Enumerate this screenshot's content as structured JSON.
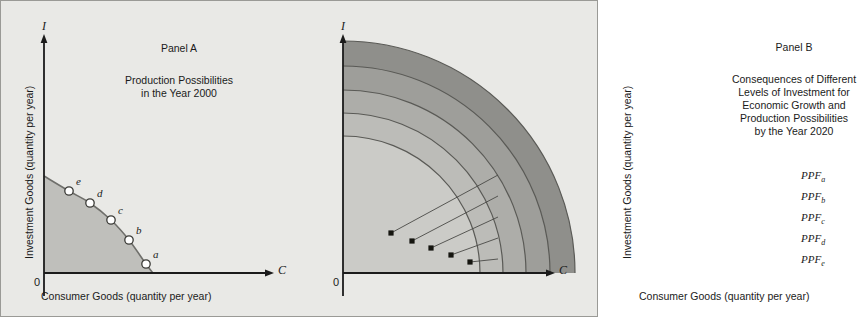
{
  "figure": {
    "background_color": "#e9e9e6",
    "border_color": "#9a9a96"
  },
  "panel_a": {
    "heading": "Panel A",
    "title": "Production Possibilities\nin the Year 2000",
    "y_axis_label": "Investment Goods (quantity per year)",
    "x_axis_label": "Consumer Goods (quantity per year)",
    "y_axis_marker": "I",
    "x_axis_marker": "C",
    "origin_label": "0",
    "curve_fill": "#bfbfbb",
    "curve_stroke": "#6f6f6b",
    "points": [
      {
        "label": "a",
        "x": 145,
        "y": 263
      },
      {
        "label": "b",
        "x": 128,
        "y": 239
      },
      {
        "label": "c",
        "x": 110,
        "y": 219
      },
      {
        "label": "d",
        "x": 89,
        "y": 202
      },
      {
        "label": "e",
        "x": 68,
        "y": 190
      }
    ]
  },
  "panel_b": {
    "heading": "Panel B",
    "title": "Consequences of Different\nLevels of Investment for\nEconomic Growth and\nProduction Possibilities\nby the Year 2020",
    "y_axis_label": "Investment Goods (quantity per year)",
    "x_axis_label": "Consumer Goods (quantity per year)",
    "y_axis_marker": "I",
    "x_axis_marker": "C",
    "origin_label": "0",
    "frontiers": [
      {
        "label": "PPF",
        "subscript": "a",
        "radius": 232,
        "fill": "#8f8f8b",
        "point": {
          "x": 390,
          "y": 232
        }
      },
      {
        "label": "PPF",
        "subscript": "b",
        "radius": 207,
        "fill": "#9e9e9a",
        "point": {
          "x": 411,
          "y": 240
        }
      },
      {
        "label": "PPF",
        "subscript": "c",
        "radius": 183,
        "fill": "#adadA9",
        "point": {
          "x": 430,
          "y": 247
        }
      },
      {
        "label": "PPF",
        "subscript": "d",
        "radius": 160,
        "fill": "#bcbcb8",
        "point": {
          "x": 450,
          "y": 254
        }
      },
      {
        "label": "PPF",
        "subscript": "e",
        "radius": 137,
        "fill": "#cbcbc7",
        "point": {
          "x": 469,
          "y": 261
        }
      }
    ],
    "arc_stroke": "#5a5a56",
    "leader_stroke": "#4a4a46"
  }
}
